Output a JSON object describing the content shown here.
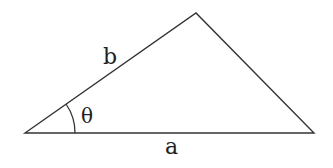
{
  "diagram": {
    "type": "triangle",
    "colors": {
      "stroke": "#333333",
      "text": "#222222",
      "background": "#ffffff"
    },
    "vertices": {
      "left": [
        25,
        133
      ],
      "top": [
        196,
        13
      ],
      "right": [
        314,
        133
      ]
    },
    "labels": {
      "side_a": "a",
      "side_b": "b",
      "angle": "θ"
    }
  }
}
